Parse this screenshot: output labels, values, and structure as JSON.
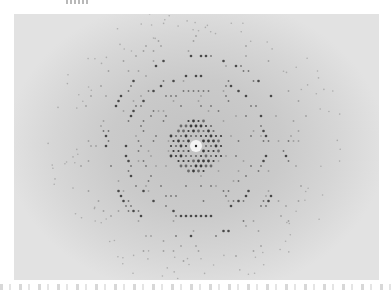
{
  "figure": {
    "type": "x-ray-diffraction-pattern",
    "frame": {
      "x": 14,
      "y": 14,
      "width": 365,
      "height": 266
    },
    "center": {
      "x": 196,
      "y": 146
    },
    "beam_stop": {
      "radius": 6,
      "color": "#f4f4f4",
      "dot_color": "#2a2a2a"
    },
    "inner_disc": {
      "radius": 27,
      "spot_spacing": 5,
      "spot_color": "#3c3c3c"
    },
    "rings": [
      {
        "radius": 42,
        "width": 4,
        "density": 0.35
      },
      {
        "radius": 56,
        "width": 6,
        "density": 0.45
      },
      {
        "radius": 70,
        "width": 5,
        "density": 0.7
      },
      {
        "radius": 90,
        "width": 6,
        "density": 0.55
      },
      {
        "radius": 108,
        "width": 10,
        "density": 0.18
      }
    ],
    "colors": {
      "background_center": "#c2c2c2",
      "background_edge": "#e2e2e2",
      "spot_dark": "#3a3a3a",
      "spot_mid": "#6a6a6a",
      "spot_light": "#9a9a9a"
    }
  }
}
